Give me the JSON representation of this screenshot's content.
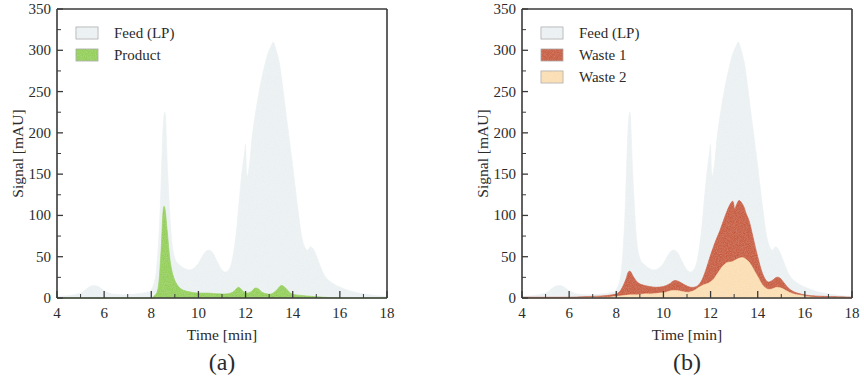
{
  "figure": {
    "panels": [
      {
        "id": "a",
        "label": "(a)",
        "xlabel": "Time [min]",
        "ylabel": "Signal [mAU]",
        "legend": [
          {
            "name": "Feed (LP)",
            "color": "#e8eef0"
          },
          {
            "name": "Product",
            "color": "#86c846"
          }
        ]
      },
      {
        "id": "b",
        "label": "(b)",
        "xlabel": "Time [min]",
        "ylabel": "Signal [mAU]",
        "legend": [
          {
            "name": "Feed (LP)",
            "color": "#e8eef0"
          },
          {
            "name": "Waste 1",
            "color": "#c0492b"
          },
          {
            "name": "Waste 2",
            "color": "#fad9a8"
          }
        ]
      }
    ]
  },
  "chart_data": [
    {
      "type": "area",
      "panel": "a",
      "title": "",
      "xlabel": "Time [min]",
      "ylabel": "Signal [mAU]",
      "xlim": [
        4,
        18
      ],
      "ylim": [
        0,
        350
      ],
      "xticks": [
        4,
        6,
        8,
        10,
        12,
        14,
        16,
        18
      ],
      "yticks": [
        0,
        50,
        100,
        150,
        200,
        250,
        300,
        350
      ],
      "grid": false,
      "legend_position": "top-left",
      "series": [
        {
          "name": "Feed (LP)",
          "color": "#e8eef0",
          "x": [
            4.0,
            4.5,
            5.0,
            5.2,
            5.4,
            5.6,
            5.8,
            6.0,
            6.3,
            6.7,
            7.0,
            7.4,
            7.8,
            8.0,
            8.2,
            8.35,
            8.45,
            8.52,
            8.6,
            8.7,
            8.85,
            9.0,
            9.2,
            9.4,
            9.6,
            9.8,
            10.0,
            10.2,
            10.4,
            10.6,
            10.8,
            11.0,
            11.2,
            11.4,
            11.6,
            11.8,
            11.95,
            12.0,
            12.05,
            12.15,
            12.3,
            12.5,
            12.7,
            12.9,
            13.0,
            13.1,
            13.18,
            13.3,
            13.45,
            13.6,
            13.8,
            14.0,
            14.2,
            14.4,
            14.6,
            14.75,
            14.9,
            15.1,
            15.3,
            15.5,
            15.8,
            16.1,
            16.5,
            17.0,
            17.5,
            18.0
          ],
          "y": [
            2,
            3,
            6,
            10,
            14,
            15,
            13,
            9,
            5,
            4,
            4,
            5,
            7,
            10,
            30,
            90,
            170,
            215,
            220,
            150,
            75,
            48,
            40,
            36,
            34,
            36,
            42,
            52,
            58,
            55,
            44,
            34,
            32,
            42,
            78,
            140,
            175,
            185,
            150,
            158,
            200,
            238,
            268,
            292,
            300,
            306,
            310,
            300,
            282,
            250,
            205,
            160,
            112,
            72,
            58,
            62,
            58,
            44,
            30,
            22,
            16,
            12,
            8,
            5,
            3,
            2
          ]
        },
        {
          "name": "Product",
          "color": "#86c846",
          "x": [
            4.0,
            7.8,
            8.1,
            8.3,
            8.42,
            8.5,
            8.58,
            8.68,
            8.8,
            8.95,
            9.15,
            9.4,
            9.7,
            10.0,
            10.4,
            10.8,
            11.2,
            11.45,
            11.6,
            11.7,
            11.8,
            11.95,
            12.1,
            12.25,
            12.4,
            12.55,
            12.7,
            12.9,
            13.1,
            13.3,
            13.45,
            13.55,
            13.7,
            13.9,
            14.1,
            14.4,
            14.8,
            15.3,
            16.0,
            18.0
          ],
          "y": [
            0,
            0,
            2,
            14,
            60,
            105,
            108,
            80,
            45,
            25,
            14,
            9,
            7,
            6,
            6,
            5,
            5,
            7,
            11,
            13,
            11,
            7,
            6,
            8,
            12,
            11,
            7,
            5,
            5,
            9,
            14,
            15,
            12,
            6,
            4,
            3,
            2,
            1,
            0,
            0
          ]
        }
      ]
    },
    {
      "type": "area",
      "panel": "b",
      "title": "",
      "xlabel": "Time [min]",
      "ylabel": "Signal [mAU]",
      "xlim": [
        4,
        18
      ],
      "ylim": [
        0,
        350
      ],
      "xticks": [
        4,
        6,
        8,
        10,
        12,
        14,
        16,
        18
      ],
      "yticks": [
        0,
        50,
        100,
        150,
        200,
        250,
        300,
        350
      ],
      "grid": false,
      "legend_position": "top-left",
      "series": [
        {
          "name": "Feed (LP)",
          "color": "#e8eef0",
          "x": [
            4.0,
            4.5,
            5.0,
            5.2,
            5.4,
            5.6,
            5.8,
            6.0,
            6.3,
            6.7,
            7.0,
            7.4,
            7.8,
            8.0,
            8.2,
            8.35,
            8.45,
            8.52,
            8.6,
            8.7,
            8.85,
            9.0,
            9.2,
            9.4,
            9.6,
            9.8,
            10.0,
            10.2,
            10.4,
            10.6,
            10.8,
            11.0,
            11.2,
            11.4,
            11.6,
            11.8,
            11.95,
            12.0,
            12.05,
            12.15,
            12.3,
            12.5,
            12.7,
            12.9,
            13.0,
            13.1,
            13.18,
            13.3,
            13.45,
            13.6,
            13.8,
            14.0,
            14.2,
            14.4,
            14.6,
            14.75,
            14.9,
            15.1,
            15.3,
            15.5,
            15.8,
            16.1,
            16.5,
            17.0,
            17.5,
            18.0
          ],
          "y": [
            2,
            3,
            6,
            10,
            14,
            15,
            13,
            9,
            5,
            4,
            4,
            5,
            7,
            10,
            30,
            90,
            170,
            215,
            220,
            150,
            75,
            48,
            40,
            36,
            34,
            36,
            42,
            52,
            58,
            55,
            44,
            34,
            32,
            42,
            78,
            140,
            175,
            185,
            150,
            158,
            200,
            238,
            268,
            292,
            300,
            306,
            310,
            300,
            282,
            250,
            205,
            160,
            112,
            72,
            58,
            62,
            58,
            44,
            30,
            22,
            16,
            12,
            8,
            5,
            3,
            2
          ]
        },
        {
          "name": "Waste 1",
          "color": "#c0492b",
          "x": [
            4.0,
            6.0,
            7.0,
            7.6,
            8.0,
            8.2,
            8.4,
            8.5,
            8.6,
            8.72,
            8.9,
            9.1,
            9.4,
            9.7,
            10.0,
            10.25,
            10.45,
            10.65,
            10.9,
            11.15,
            11.4,
            11.6,
            11.8,
            12.0,
            12.2,
            12.4,
            12.6,
            12.8,
            12.95,
            13.02,
            13.1,
            13.2,
            13.3,
            13.42,
            13.5,
            13.65,
            13.8,
            14.0,
            14.2,
            14.4,
            14.6,
            14.8,
            14.95,
            15.1,
            15.3,
            15.5,
            15.8,
            16.2,
            16.8,
            18.0
          ],
          "y": [
            1,
            1,
            2,
            3,
            5,
            10,
            22,
            31,
            32,
            26,
            19,
            16,
            14,
            13,
            14,
            17,
            21,
            20,
            16,
            13,
            14,
            20,
            34,
            52,
            68,
            82,
            98,
            112,
            117,
            108,
            113,
            118,
            116,
            110,
            103,
            92,
            74,
            50,
            30,
            20,
            21,
            25,
            24,
            19,
            12,
            8,
            5,
            3,
            2,
            1
          ]
        },
        {
          "name": "Waste 2",
          "color": "#fad9a8",
          "x": [
            4.0,
            6.0,
            7.0,
            7.6,
            8.0,
            8.3,
            8.6,
            8.9,
            9.2,
            9.5,
            9.8,
            10.1,
            10.35,
            10.55,
            10.8,
            11.05,
            11.3,
            11.5,
            11.7,
            11.9,
            12.1,
            12.3,
            12.5,
            12.7,
            12.9,
            13.05,
            13.2,
            13.35,
            13.5,
            13.65,
            13.8,
            14.0,
            14.2,
            14.4,
            14.6,
            14.8,
            15.0,
            15.2,
            15.5,
            15.9,
            16.4,
            18.0
          ],
          "y": [
            0,
            0,
            1,
            1,
            2,
            3,
            4,
            4,
            5,
            5,
            6,
            7,
            9,
            9,
            8,
            7,
            9,
            13,
            16,
            18,
            22,
            30,
            38,
            43,
            44,
            46,
            48,
            49,
            47,
            43,
            36,
            26,
            16,
            11,
            11,
            13,
            12,
            9,
            5,
            3,
            1,
            0
          ]
        }
      ]
    }
  ]
}
